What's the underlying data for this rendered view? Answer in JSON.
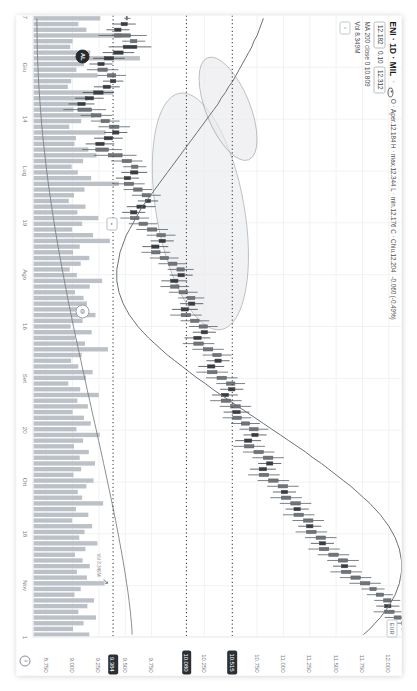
{
  "app": {
    "name": "tradingview-chart",
    "orientation": "landscape-rotated"
  },
  "legend": {
    "symbol": "ENI · 1D · MIL",
    "separator": "·",
    "eye_icon": "eye-icon",
    "ohlc": "O 12.184 H 12.344 L 12.176 C 12.204",
    "ohlc_open_label": "Aper.",
    "ohlc_full": "O · Aper.12.184 H · max.12.344 L · min.12.176 C · Chiu.12.204",
    "change": "-0.060 (-0.49%)",
    "last_price": "12.182",
    "change_pct": "0.10",
    "quote_badge": "12.312",
    "ma_line": "MA 200 close 0 10.809",
    "volume_line": "Vol 8.349M",
    "collapse_icon": "chevron-left-icon",
    "currency_badge": "EUR"
  },
  "price_axis": {
    "name": "price-scale",
    "clock_icon": "clock-icon",
    "labels": [
      "12.000",
      "11.750",
      "11.500",
      "11.250",
      "11.000",
      "10.750",
      "10.250",
      "9.750",
      "9.500",
      "9.250",
      "9.000",
      "8.750"
    ],
    "highlight_badges": [
      {
        "value": "10.515",
        "style": "dark"
      },
      {
        "value": "10.080",
        "style": "dark"
      },
      {
        "value": "9.384",
        "style": "dark"
      }
    ]
  },
  "time_axis": {
    "name": "time-scale",
    "labels": [
      "17",
      "Giu",
      "14",
      "Lug",
      "19",
      "Ago",
      "16",
      "Set",
      "20",
      "Ott",
      "18",
      "Nov",
      "1"
    ]
  },
  "markers": {
    "cursor_chip": "C",
    "magnet_chip": "AL",
    "eye_chip": "eye-icon",
    "measure_chip": "ruler-icon",
    "arrow_icon": "arrow-up-icon"
  },
  "chart_data": {
    "type": "line",
    "title": "ENI · 1D · MIL",
    "xlabel": "",
    "ylabel": "EUR",
    "ylim": [
      8.62,
      12.12
    ],
    "xlim": [
      "2024-06-17",
      "2024-11-01"
    ],
    "grid": true,
    "legend_position": "top-left",
    "price_levels": [
      {
        "label": "10.515",
        "value": 10.515,
        "style": "dotted"
      },
      {
        "label": "10.080",
        "value": 10.08,
        "style": "dotted"
      },
      {
        "label": "9.384",
        "value": 9.384,
        "style": "dotted"
      }
    ],
    "annotations": [
      {
        "type": "ellipse",
        "note": "upper shaded ellipse over consolidation"
      },
      {
        "type": "ellipse",
        "note": "lower shaded ellipse over base"
      }
    ],
    "series": [
      {
        "name": "ENI daily close",
        "type": "candlestick",
        "values": [
          9.52,
          9.46,
          9.4,
          9.55,
          9.61,
          9.48,
          9.39,
          9.3,
          9.24,
          9.33,
          9.41,
          9.36,
          9.29,
          9.2,
          9.12,
          9.05,
          9.18,
          9.27,
          9.35,
          9.44,
          9.38,
          9.3,
          9.22,
          9.34,
          9.47,
          9.56,
          9.62,
          9.55,
          9.49,
          9.58,
          9.66,
          9.74,
          9.69,
          9.61,
          9.55,
          9.63,
          9.71,
          9.8,
          9.88,
          9.82,
          9.75,
          9.83,
          9.91,
          9.99,
          10.06,
          10.0,
          9.93,
          10.01,
          10.09,
          10.16,
          10.1,
          10.03,
          10.12,
          10.2,
          10.28,
          10.22,
          10.15,
          10.24,
          10.33,
          10.41,
          10.35,
          10.28,
          10.37,
          10.46,
          10.54,
          10.48,
          10.41,
          10.5,
          10.59,
          10.52,
          10.6,
          10.68,
          10.76,
          10.7,
          10.63,
          10.72,
          10.81,
          10.9,
          10.84,
          10.77,
          10.86,
          10.95,
          11.04,
          10.98,
          11.07,
          11.16,
          11.1,
          11.19,
          11.28,
          11.22,
          11.31,
          11.4,
          11.34,
          11.43,
          11.52,
          11.61,
          11.55,
          11.64,
          11.73,
          11.82,
          11.88,
          11.95,
          12.02,
          11.96,
          12.05,
          12.12,
          12.18,
          12.22,
          12.2
        ]
      },
      {
        "name": "MA 200 close",
        "type": "line",
        "color": "#6b7075",
        "values": [
          10.81,
          10.79,
          10.77,
          10.75,
          10.72,
          10.7,
          10.67,
          10.64,
          10.61,
          10.58,
          10.55,
          10.52,
          10.48,
          10.45,
          10.41,
          10.38,
          10.34,
          10.3,
          10.26,
          10.22,
          10.18,
          10.14,
          10.1,
          10.06,
          10.02,
          9.98,
          9.94,
          9.9,
          9.86,
          9.82,
          9.78,
          9.74,
          9.7,
          9.66,
          9.63,
          9.6,
          9.57,
          9.54,
          9.51,
          9.49,
          9.47,
          9.45,
          9.44,
          9.43,
          9.42,
          9.42,
          9.42,
          9.43,
          9.44,
          9.46,
          9.48,
          9.51,
          9.54,
          9.58,
          9.62,
          9.67,
          9.72,
          9.78,
          9.84,
          9.9,
          9.97,
          10.04,
          10.11,
          10.18,
          10.26,
          10.33,
          10.41,
          10.49,
          10.57,
          10.65,
          10.73,
          10.81,
          10.89,
          10.97,
          11.05,
          11.13,
          11.21,
          11.28,
          11.36,
          11.43,
          11.5,
          11.57,
          11.64,
          11.7,
          11.76,
          11.82,
          11.87,
          11.92,
          11.96,
          12.0,
          12.03,
          12.06,
          12.08,
          12.1,
          12.11,
          12.12,
          12.12,
          12.12,
          12.11,
          12.1,
          12.08,
          12.06,
          12.03,
          12.0,
          11.96,
          11.92,
          11.87,
          11.82,
          11.76
        ]
      },
      {
        "name": "Volume",
        "type": "bar",
        "values": [
          14.2,
          9.6,
          11.3,
          18.7,
          8.4,
          7.9,
          12.1,
          22.5,
          10.8,
          9.2,
          13.6,
          8.1,
          7.4,
          16.9,
          11.5,
          9.8,
          8.6,
          12.9,
          10.2,
          7.7,
          15.3,
          9.1,
          8.8,
          11.7,
          13.4,
          10.6,
          8.2,
          9.5,
          12.3,
          18.1,
          10.9,
          8.7,
          7.6,
          11.1,
          9.4,
          13.8,
          10.4,
          8.3,
          12.7,
          16.2,
          9.9,
          8.5,
          11.9,
          10.1,
          7.8,
          9.3,
          14.6,
          12.0,
          8.9,
          10.7,
          11.4,
          9.7,
          13.2,
          10.5,
          8.0,
          12.4,
          9.0,
          11.0,
          15.8,
          10.3,
          8.1,
          9.6,
          12.6,
          11.2,
          7.5,
          10.0,
          13.9,
          9.4,
          11.6,
          8.4,
          10.8,
          12.2,
          9.2,
          14.1,
          10.6,
          8.7,
          11.8,
          9.9,
          13.1,
          10.2,
          8.6,
          12.8,
          11.3,
          9.5,
          10.4,
          14.8,
          9.1,
          11.7,
          8.3,
          12.5,
          10.9,
          9.8,
          13.6,
          11.1,
          8.9,
          10.5,
          12.0,
          9.3,
          11.4,
          15.1,
          10.1,
          8.8,
          12.9,
          11.5,
          9.6,
          13.3,
          10.7,
          8.5,
          11.9
        ]
      }
    ]
  }
}
